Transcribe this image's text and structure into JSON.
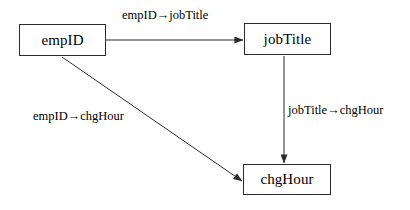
{
  "diagram": {
    "type": "directed-graph",
    "colors": {
      "background": "#ffffff",
      "node_border": "#2b2b2b",
      "node_fill": "#ffffff",
      "edge": "#2b2b2b",
      "text": "#000000"
    },
    "nodes": [
      {
        "id": "empID",
        "label": "empID",
        "x": 19,
        "y": 24,
        "width": 87,
        "height": 32
      },
      {
        "id": "jobTitle",
        "label": "jobTitle",
        "x": 244,
        "y": 23,
        "width": 87,
        "height": 32
      },
      {
        "id": "chgHour",
        "label": "chgHour",
        "x": 243,
        "y": 164,
        "width": 88,
        "height": 31
      }
    ],
    "edges": [
      {
        "id": "empid-to-jobtitle",
        "from": "empID",
        "to": "jobTitle",
        "label": "empID→jobTitle",
        "style": "straight-horizontal",
        "arrowhead": "solid-triangle"
      },
      {
        "id": "empid-to-chghour",
        "from": "empID",
        "to": "chgHour",
        "label": "empID→chgHour",
        "style": "straight-diagonal",
        "arrowhead": "solid-triangle"
      },
      {
        "id": "jobtitle-to-chghour",
        "from": "jobTitle",
        "to": "chgHour",
        "label": "jobTitle→chgHour",
        "style": "straight-vertical",
        "arrowhead": "solid-triangle"
      }
    ]
  }
}
